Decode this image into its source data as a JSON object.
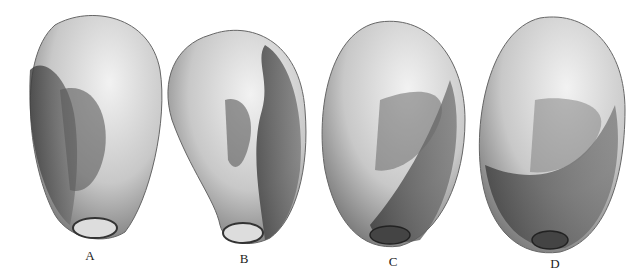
{
  "figure": {
    "panels": [
      {
        "label": "A",
        "x": 90,
        "y": 248
      },
      {
        "label": "B",
        "x": 244,
        "y": 251
      },
      {
        "label": "C",
        "x": 393,
        "y": 254
      },
      {
        "label": "D",
        "x": 555,
        "y": 256
      }
    ],
    "colors": {
      "background": "#ffffff",
      "light": "#e6e6e6",
      "mid": "#a8a8a8",
      "dark": "#4a4a4a",
      "ink": "#222222"
    }
  }
}
